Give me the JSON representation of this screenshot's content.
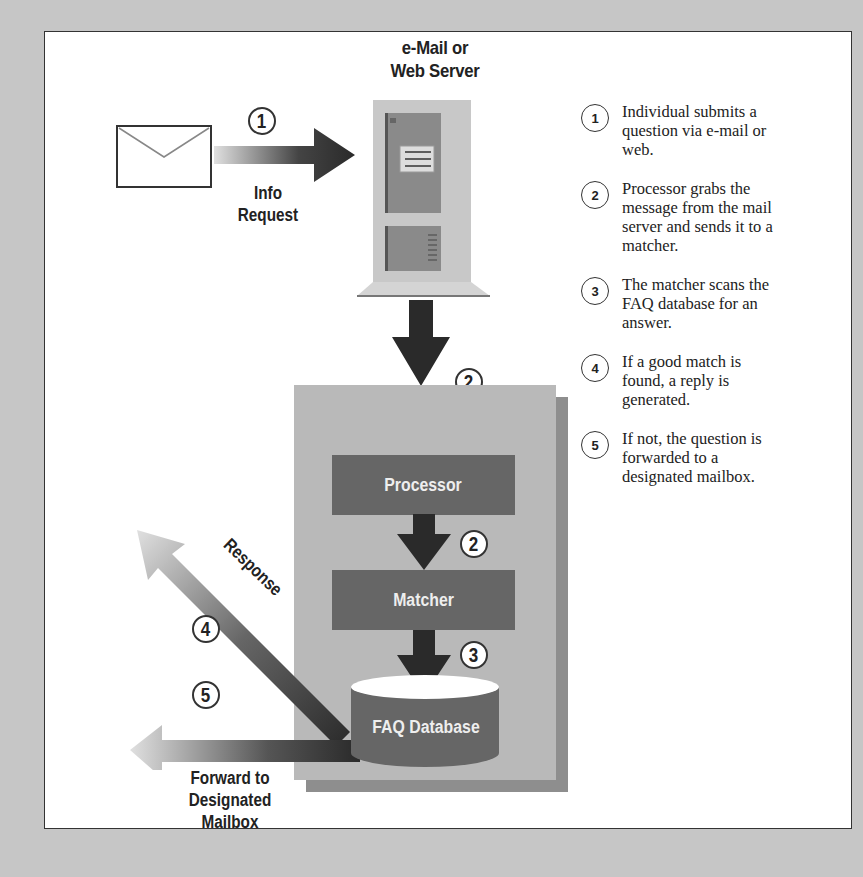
{
  "diagram": {
    "title_line1": "e-Mail or",
    "title_line2": "Web Server",
    "request_label_line1": "Info",
    "request_label_line2": "Request",
    "response_label": "Response",
    "forward_label_line1": "Forward to",
    "forward_label_line2": "Designated",
    "forward_label_line3": "Mailbox",
    "processor_label": "Processor",
    "matcher_label": "Matcher",
    "database_label": "FAQ Database",
    "step_markers": {
      "request": "1",
      "server_to_processor": "2",
      "processor_to_matcher": "2",
      "matcher_to_database": "3",
      "response": "4",
      "forward": "5"
    }
  },
  "legend": {
    "items": [
      {
        "num": "1",
        "text": "Individual submits a question via e-mail or web."
      },
      {
        "num": "2",
        "text": "Processor grabs the message from the mail server and sends it to a matcher."
      },
      {
        "num": "3",
        "text": "The matcher scans the FAQ database for an answer."
      },
      {
        "num": "4",
        "text": "If a good match is found, a reply is generated."
      },
      {
        "num": "5",
        "text": "If not, the question is forwarded to a designated mailbox."
      }
    ]
  },
  "colors": {
    "background": "#c6c6c6",
    "panel": "#ffffff",
    "box_gray": "#b9b9b9",
    "dark_box": "#666666",
    "arrow_dark": "#2a2a2a"
  }
}
